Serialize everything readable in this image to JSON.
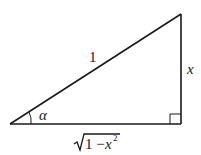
{
  "diagram": {
    "type": "right-triangle",
    "labels": {
      "hypotenuse": "1",
      "opposite": "x",
      "angle": "α",
      "adjacent_radicand_1": "1 − ",
      "adjacent_var": "x",
      "adjacent_exp": "2"
    },
    "right_angle_marker": true,
    "colors": {
      "stroke": "#1a1a1a",
      "background": "#ffffff"
    }
  }
}
